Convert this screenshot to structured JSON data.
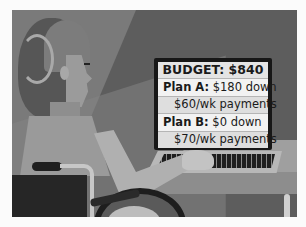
{
  "illustration": {
    "description": "Person in wheelchair at desk using laptop displaying budget",
    "style": "grayscale flat illustration"
  },
  "screen_panel": {
    "title": "BUDGET: $840",
    "rows": [
      {
        "label": "Plan A:",
        "value": "$180 down"
      },
      {
        "sub": "$60/wk payments"
      },
      {
        "label": "Plan B:",
        "value": "$0 down"
      },
      {
        "sub": "$70/wk payments"
      }
    ]
  },
  "colors": {
    "background": "#fbfbfb",
    "frame": "#6e6e6e",
    "panel": "#e6e6e6",
    "text": "#1a1a1a"
  }
}
